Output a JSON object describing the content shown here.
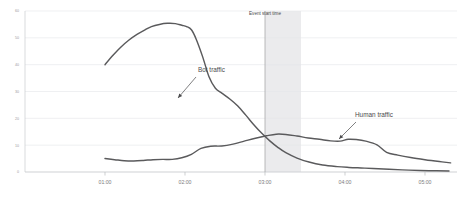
{
  "chart_data": {
    "type": "line",
    "title": "",
    "subtitle": "",
    "xlabel": "",
    "ylabel": "",
    "grid": "horizontal",
    "legend_position": "inline-callouts",
    "xlim": [
      0,
      5.4
    ],
    "ylim": [
      0,
      60
    ],
    "x_tick_labels": [
      "01:00",
      "02:00",
      "03:00",
      "04:00",
      "05:00"
    ],
    "x_tick_values": [
      1,
      2,
      3,
      4,
      5
    ],
    "y_tick_labels": [
      "0",
      "10",
      "20",
      "30",
      "40",
      "50",
      "60"
    ],
    "y_tick_values": [
      0,
      10,
      20,
      30,
      40,
      50,
      60
    ],
    "series": [
      {
        "name": "Bot traffic",
        "color": "#5a5a5c",
        "x": [
          1.0,
          1.1,
          1.2,
          1.3,
          1.4,
          1.5,
          1.58,
          1.68,
          1.78,
          1.88,
          1.96,
          2.02,
          2.08,
          2.14,
          2.22,
          2.3,
          2.38,
          2.46,
          2.56,
          2.66,
          2.76,
          2.86,
          2.96,
          3.06,
          3.16,
          3.26,
          3.4,
          3.55,
          3.72,
          3.9,
          4.05,
          4.2,
          4.35,
          4.55,
          4.8,
          5.05,
          5.3
        ],
        "values": [
          40.0,
          43.5,
          46.6,
          49.2,
          51.3,
          53.0,
          54.2,
          55.0,
          55.4,
          55.3,
          54.7,
          54.2,
          53.0,
          49.5,
          43.0,
          35.5,
          31.2,
          29.4,
          27.2,
          24.6,
          21.2,
          17.6,
          14.4,
          11.6,
          9.2,
          7.2,
          5.2,
          3.7,
          2.6,
          2.0,
          1.7,
          1.5,
          1.3,
          1.0,
          0.7,
          0.5,
          0.4
        ]
      },
      {
        "name": "Human traffic",
        "color": "#5a5a5c",
        "x": [
          1.0,
          1.12,
          1.24,
          1.36,
          1.48,
          1.6,
          1.72,
          1.84,
          1.96,
          2.08,
          2.2,
          2.32,
          2.46,
          2.6,
          2.74,
          2.88,
          3.02,
          3.14,
          3.26,
          3.4,
          3.54,
          3.68,
          3.82,
          3.94,
          4.04,
          4.14,
          4.26,
          4.4,
          4.52,
          4.66,
          4.82,
          5.0,
          5.18,
          5.32
        ],
        "values": [
          5.0,
          4.6,
          4.2,
          4.1,
          4.3,
          4.6,
          4.7,
          4.7,
          5.3,
          6.6,
          8.8,
          9.6,
          9.7,
          10.4,
          11.5,
          12.6,
          13.5,
          14.1,
          14.0,
          13.4,
          12.7,
          12.2,
          11.6,
          11.5,
          12.2,
          12.1,
          11.5,
          10.1,
          7.3,
          6.3,
          5.4,
          4.6,
          3.9,
          3.4
        ]
      }
    ],
    "annotations": [
      {
        "name": "bot-traffic-callout",
        "text": "Bot traffic",
        "label_x": 198,
        "label_y": 72,
        "arrow_from_x": 196,
        "arrow_from_y": 77,
        "arrow_to_x": 178,
        "arrow_to_y": 98
      },
      {
        "name": "human-traffic-callout",
        "text": "Human traffic",
        "label_x": 355,
        "label_y": 117,
        "arrow_from_x": 356,
        "arrow_from_y": 122,
        "arrow_to_x": 339,
        "arrow_to_y": 139
      },
      {
        "name": "event-start-marker",
        "text": "Event start time",
        "x_value": 3.0,
        "band_start": 3.0,
        "band_end": 3.45
      }
    ],
    "colors": {
      "line": "#5a5a5c",
      "gridline": "#e4e6ea",
      "axis": "#c9cbcf",
      "event_band": "#ebebed",
      "event_line": "#a8a8aa",
      "background": "#ffffff",
      "tick_text": "#7c7c7e",
      "annotation_text": "#4a4a4c"
    }
  }
}
